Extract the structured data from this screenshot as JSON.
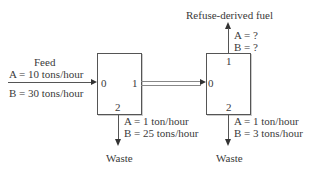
{
  "feed": {
    "title": "Feed",
    "a": "A = 10 tons/hour",
    "b": "B = 30 tons/hour"
  },
  "unit1": {
    "port_in": "0",
    "port_out": "1",
    "port_waste": "2",
    "waste": {
      "a": "A = 1 ton/hour",
      "b": "B = 25 tons/hour",
      "label": "Waste"
    }
  },
  "unit2": {
    "port_in": "0",
    "port_out": "1",
    "port_waste": "2",
    "product": {
      "label": "Refuse-derived fuel",
      "a": "A = ?",
      "b": "B = ?"
    },
    "waste": {
      "a": "A = 1 ton/hour",
      "b": "B = 3 tons/hour",
      "label": "Waste"
    }
  }
}
